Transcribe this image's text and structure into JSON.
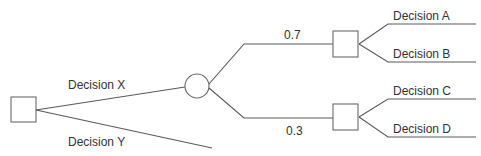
{
  "diagram": {
    "type": "decision-tree",
    "colors": {
      "line": "#5a5a5a",
      "node_border": "#6a6a6a",
      "text": "#333333",
      "background": "#ffffff"
    },
    "nodes": {
      "root": {
        "kind": "decision",
        "shape": "square"
      },
      "chance": {
        "kind": "chance",
        "shape": "circle"
      },
      "upper_decision": {
        "kind": "decision",
        "shape": "square"
      },
      "lower_decision": {
        "kind": "decision",
        "shape": "square"
      }
    },
    "edges": {
      "decision_x": {
        "label": "Decision X"
      },
      "decision_y": {
        "label": "Decision Y"
      },
      "prob_upper": {
        "label": "0.7"
      },
      "prob_lower": {
        "label": "0.3"
      },
      "decision_a": {
        "label": "Decision A"
      },
      "decision_b": {
        "label": "Decision B"
      },
      "decision_c": {
        "label": "Decision C"
      },
      "decision_d": {
        "label": "Decision D"
      }
    }
  }
}
